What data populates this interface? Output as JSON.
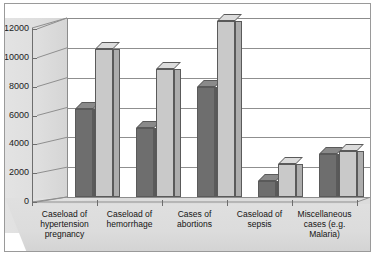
{
  "chart_data": {
    "type": "bar",
    "title": "",
    "subtitle": "",
    "xlabel": "",
    "ylabel": "",
    "ylim": [
      0,
      12000
    ],
    "ytick_labels": [
      "0",
      "2000",
      "4000",
      "6000",
      "8000",
      "10000",
      "12000"
    ],
    "ytick_values": [
      0,
      2000,
      4000,
      6000,
      8000,
      10000,
      12000
    ],
    "grid": true,
    "legend": "none",
    "style": "3d-clustered-column",
    "categories": [
      "Caseload of hypertension pregnancy",
      "Caseload of hemorrhage",
      "Cases of abortions",
      "Caseload of sepsis",
      "Miscellaneous cases (e.g. Malaria)"
    ],
    "series": [
      {
        "name": "series-1",
        "color": "#6e6e6e",
        "values": [
          5900,
          4600,
          7400,
          1100,
          2900
        ]
      },
      {
        "name": "series-2",
        "color": "#c9c9c9",
        "values": [
          9900,
          8600,
          11800,
          2200,
          3100
        ]
      }
    ]
  },
  "colors": {
    "series_dark": "#6e6e6e",
    "series_light": "#c9c9c9",
    "wall": "#dedede",
    "floor": "#dcdcdc",
    "plot_background": "#ffffff",
    "gridline": "#8f8f8f",
    "axis": "#6e6e6e",
    "frame": "#9a9a9a",
    "text": "#141414"
  }
}
